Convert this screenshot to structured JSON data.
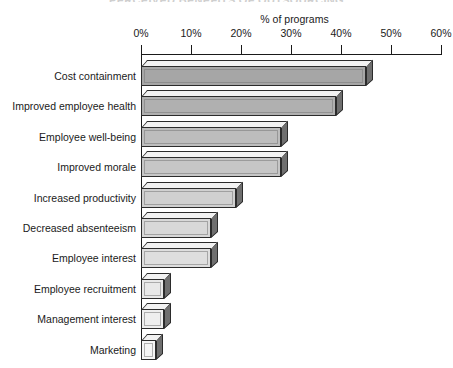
{
  "chart": {
    "title": "PERCEIVED BENEFITS OF OUTSOURCING",
    "axis_label": "% of programs",
    "x_ticks": [
      "0%",
      "10%",
      "20%",
      "30%",
      "40%",
      "50%",
      "60%"
    ]
  },
  "chart_data": {
    "type": "bar",
    "orientation": "horizontal",
    "title": "PERCEIVED BENEFITS OF OUTSOURCING",
    "xlabel": "% of programs",
    "ylabel": "",
    "xlim": [
      0,
      60
    ],
    "xtick_values": [
      0,
      10,
      20,
      30,
      40,
      50,
      60
    ],
    "xtick_labels": [
      "0%",
      "10%",
      "20%",
      "30%",
      "40%",
      "50%",
      "60%"
    ],
    "grid": false,
    "legend": "none",
    "categories": [
      "Cost containment",
      "Improved employee health",
      "Employee well-being",
      "Improved morale",
      "Increased productivity",
      "Decreased absenteeism",
      "Employee interest",
      "Employee recruitment",
      "Management interest",
      "Marketing"
    ],
    "values": [
      45,
      39,
      28,
      28,
      19,
      14,
      14,
      4.5,
      4.5,
      3
    ],
    "bar_colors": [
      "#a6a6a6",
      "#b0b0b0",
      "#bdbdbd",
      "#c6c6c6",
      "#d0d0d0",
      "#d8d8d8",
      "#dedede",
      "#e8e8e8",
      "#eeeeee",
      "#f4f4f4"
    ]
  }
}
